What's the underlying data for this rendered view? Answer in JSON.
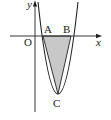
{
  "diagram": {
    "type": "parabola-triangle",
    "labels": {
      "y_axis": "y",
      "x_axis": "x",
      "origin": "O",
      "point_a": "A",
      "point_b": "B",
      "point_c": "C"
    },
    "colors": {
      "stroke": "#222222",
      "shade": "#c8c8c8",
      "background": "#ffffff"
    }
  }
}
